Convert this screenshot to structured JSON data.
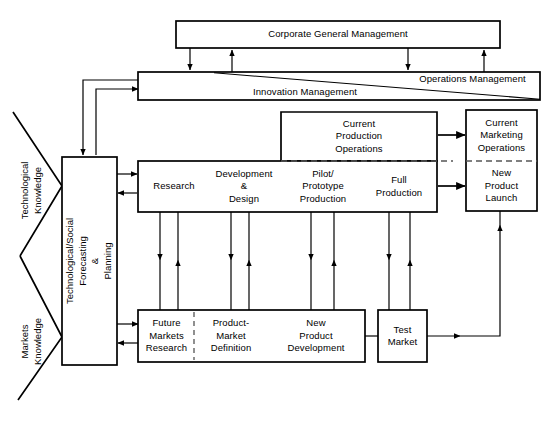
{
  "diagram": {
    "line_color": "#000000",
    "background_color": "#ffffff",
    "boxes": {
      "corporate_general_management": "Corporate General Management",
      "operations_management": "Operations Management",
      "innovation_management": "Innovation  Management",
      "forecasting_planning": "Technological/Social\nForecasting\n&\nPlanning",
      "current_production_operations": "Current\nProduction\nOperations",
      "current_marketing_operations": "Current\nMarketing\nOperations",
      "new_product_launch": "New\nProduct\nLaunch",
      "research": "Research",
      "development_design": "Development\n&\nDesign",
      "pilot_prototype_production": "Pilot/\nPrototype\nProduction",
      "full_production": "Full\nProduction",
      "future_markets_research": "Future\nMarkets\nResearch",
      "product_market_definition": "Product-\nMarket\nDefinition",
      "new_product_development": "New\nProduct\nDevelopment",
      "test_market": "Test\nMarket"
    },
    "inputs": {
      "technological_knowledge": "Technological\nKnowledge",
      "markets_knowledge": "Markets\nKnowledge"
    }
  }
}
